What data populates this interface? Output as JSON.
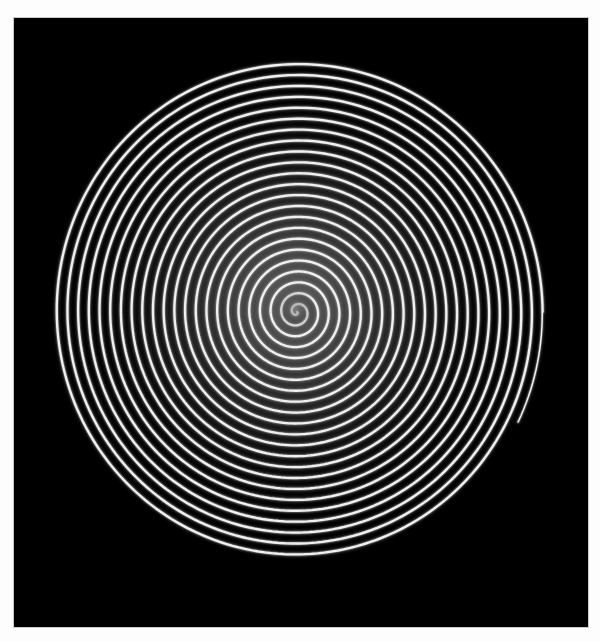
{
  "artwork": {
    "title": "Double Archimedean Spiral",
    "medium": "monochrome line drawing",
    "canvas": {
      "background_color": "#000000",
      "page_color": "#fdfdfd",
      "border_color": "#c9c9c9",
      "left": 14,
      "top": 18,
      "width": 574,
      "height": 609
    },
    "figure": {
      "name": "double-spiral",
      "line_color": "#f2f2f2",
      "glow_color": "#8a8a8a",
      "haze_color": "#5a5a5a",
      "center_x": 283,
      "center_y": 294,
      "outer_radius_x": 246,
      "outer_radius_y": 251,
      "turns": 23,
      "pair_offset_deg": 26,
      "line_width": 1.6,
      "direction": "clockwise-outward",
      "arm_count": 2
    }
  },
  "chart_data": {
    "type": "line",
    "title": "Double Archimedean Spiral",
    "xlabel": "",
    "ylabel": "",
    "series": [
      {
        "name": "spiral-arm-a",
        "phase_offset_deg": 0
      },
      {
        "name": "spiral-arm-b",
        "phase_offset_deg": 26
      }
    ],
    "parameters": {
      "equation": "r = a + b*theta",
      "a": 0,
      "b_x": 1.702,
      "b_y": 1.737,
      "theta_max_deg": 8280,
      "turns": 23,
      "center": [
        283,
        294
      ]
    },
    "axis_ranges": {
      "x": [
        37,
        529
      ],
      "y": [
        43,
        545
      ]
    },
    "grid": false,
    "legend": "none"
  }
}
